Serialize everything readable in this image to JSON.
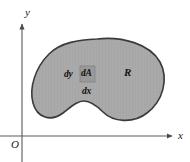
{
  "figure": {
    "type": "math-diagram",
    "canvas": {
      "width": 190,
      "height": 162,
      "background": "#ffffff"
    },
    "axes": {
      "origin_label": "O",
      "x_axis_label": "x",
      "y_axis_label": "y",
      "color": "#555555",
      "x_axis_y": 136,
      "y_axis_x": 22,
      "x_axis_start": 0,
      "x_axis_end": 176,
      "y_axis_top": 20,
      "y_axis_bottom": 162
    },
    "region": {
      "label": "R",
      "fill_color": "#a9a9a9",
      "stroke_color": "#3a3a3a",
      "stroke_width": 1.6,
      "bounds": {
        "left": 33,
        "top": 39,
        "right": 164,
        "bottom": 121
      }
    },
    "area_element": {
      "label": "dA",
      "width_label": "dx",
      "height_label": "dy",
      "fill_color": "#9a9a9a",
      "stroke_color": "#7c7c7c",
      "rect": {
        "x": 80,
        "y": 66,
        "width": 15,
        "height": 16
      }
    }
  }
}
